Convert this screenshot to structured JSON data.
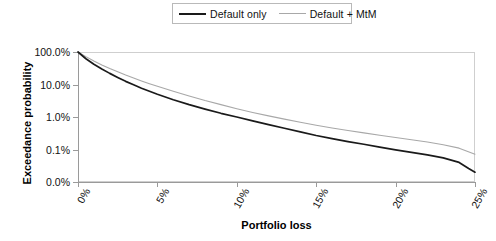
{
  "chart_data": {
    "type": "line",
    "title": "",
    "xlabel": "Portfolio loss",
    "ylabel": "Exceedance probability",
    "yscale": "log",
    "ylim": [
      0.0003,
      1.0
    ],
    "xlim": [
      0,
      25
    ],
    "grid": false,
    "legend_position": "top-center",
    "x_tick_labels": [
      "0%",
      "5%",
      "10%",
      "15%",
      "20%",
      "25%"
    ],
    "x_tick_values": [
      0,
      5,
      10,
      15,
      20,
      25
    ],
    "y_tick_labels": [
      "100.0%",
      "10.0%",
      "1.0%",
      "0.1%",
      "0.0%"
    ],
    "y_tick_values": [
      100.0,
      10.0,
      1.0,
      0.1,
      0.01
    ],
    "series": [
      {
        "name": "Default only",
        "color": "#1a1a1a",
        "x": [
          0,
          0.5,
          1,
          1.5,
          2,
          2.5,
          3,
          3.5,
          4,
          4.5,
          5,
          6,
          7,
          8,
          9,
          10,
          11,
          12,
          13,
          14,
          15,
          16,
          17,
          18,
          19,
          20,
          21,
          22,
          23,
          24,
          24.6,
          25
        ],
        "values": [
          100.0,
          62.0,
          42.0,
          30.0,
          22.0,
          16.5,
          12.5,
          9.8,
          7.7,
          6.2,
          5.0,
          3.4,
          2.4,
          1.75,
          1.3,
          1.0,
          0.76,
          0.58,
          0.45,
          0.35,
          0.27,
          0.215,
          0.175,
          0.145,
          0.118,
          0.098,
          0.082,
          0.068,
          0.055,
          0.04,
          0.026,
          0.02
        ]
      },
      {
        "name": "Default + MtM",
        "color": "#a8a8a8",
        "x": [
          0,
          0.5,
          1,
          1.5,
          2,
          2.5,
          3,
          3.5,
          4,
          4.5,
          5,
          6,
          7,
          8,
          9,
          10,
          11,
          12,
          13,
          14,
          15,
          16,
          17,
          18,
          19,
          20,
          21,
          22,
          23,
          24,
          25
        ],
        "values": [
          100.0,
          72.0,
          53.0,
          40.0,
          31.0,
          24.5,
          19.5,
          15.8,
          12.9,
          10.6,
          8.8,
          6.2,
          4.4,
          3.2,
          2.4,
          1.8,
          1.38,
          1.08,
          0.86,
          0.69,
          0.56,
          0.46,
          0.385,
          0.325,
          0.275,
          0.235,
          0.2,
          0.17,
          0.14,
          0.11,
          0.072
        ]
      }
    ]
  },
  "legend": {
    "entries": [
      {
        "label": "Default only"
      },
      {
        "label": "Default + MtM"
      }
    ]
  },
  "axes": {
    "y_title": "Exceedance probability",
    "x_title": "Portfolio loss",
    "y_ticks": [
      "100.0%",
      "10.0%",
      "1.0%",
      "0.1%",
      "0.0%"
    ],
    "x_ticks": [
      "0%",
      "5%",
      "10%",
      "15%",
      "20%",
      "25%"
    ]
  },
  "colors": {
    "series_dark": "#1a1a1a",
    "series_light": "#a8a8a8",
    "frame": "#cfcfcf",
    "axis": "#9a9a9a",
    "text": "#111111",
    "background": "#ffffff"
  }
}
